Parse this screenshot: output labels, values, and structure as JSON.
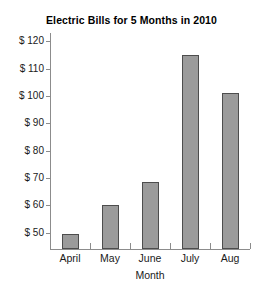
{
  "chart_data": {
    "type": "bar",
    "title": "Electric Bills for 5 Months in 2010",
    "xlabel": "Month",
    "ylabel": "",
    "categories": [
      "April",
      "May",
      "June",
      "July",
      "Aug"
    ],
    "values": [
      49.5,
      60,
      68.5,
      115,
      101
    ],
    "ytick_labels": [
      "$ 120",
      "$ 110",
      "$ 100",
      "$ 90",
      "$ 80",
      "$ 70",
      "$ 60",
      "$ 50"
    ],
    "ytick_values": [
      120,
      110,
      100,
      90,
      80,
      70,
      60,
      50
    ],
    "ylim": [
      44,
      123
    ],
    "grid": false,
    "legend": null,
    "bar_color": "#9b9b9b",
    "bar_edge_color": "#4d4d4d",
    "axis_color": "#8c8c8c",
    "background": "#ffffff"
  }
}
